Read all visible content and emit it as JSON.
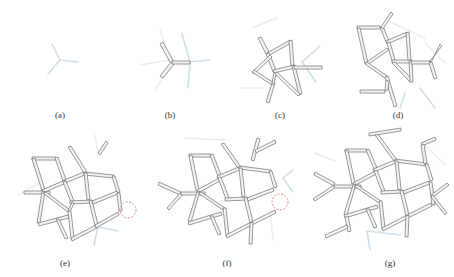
{
  "figure": {
    "panels": [
      {
        "id": "a",
        "label": "(a)",
        "stage": 1
      },
      {
        "id": "b",
        "label": "(b)",
        "stage": 2
      },
      {
        "id": "c",
        "label": "(c)",
        "stage": 3
      },
      {
        "id": "d",
        "label": "(d)",
        "stage": 4
      },
      {
        "id": "e",
        "label": "(e)",
        "stage": 5,
        "highlight": "red dashed circle"
      },
      {
        "id": "f",
        "label": "(f)",
        "stage": 6,
        "highlight": "red dashed circle"
      },
      {
        "id": "g",
        "label": "(g)",
        "stage": 7
      }
    ]
  },
  "colors": {
    "rod_fill": "#f3f3f3",
    "rod_stroke": "#6f6f6f",
    "ghost": "#cfe0ea",
    "highlight": "#e07070"
  }
}
